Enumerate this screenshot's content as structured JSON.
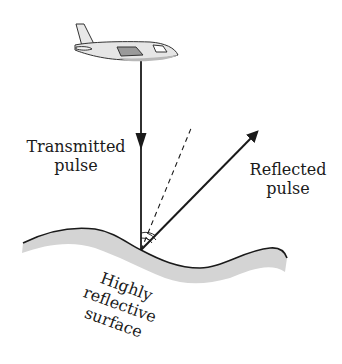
{
  "diagram": {
    "type": "lidar-reflection",
    "labels": {
      "transmitted": [
        "Transmitted",
        "pulse"
      ],
      "reflected": [
        "Reflected",
        "pulse"
      ],
      "surface": [
        "Highly",
        "reflective",
        "surface"
      ]
    },
    "colors": {
      "stroke": "#1a1a1a",
      "surface_fill": "#d4d4d4",
      "plane_body": "#e6e6e6",
      "plane_window": "#9a9a9a"
    }
  }
}
